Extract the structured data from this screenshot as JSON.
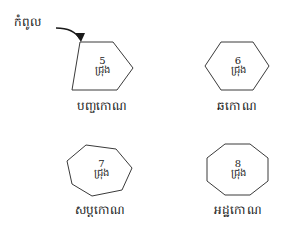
{
  "diagram": {
    "title_text": "",
    "background_color": "#ffffff",
    "stroke_color": "#3a3a3a",
    "text_color": "#1a1a1a"
  },
  "annotation": {
    "label": "កំពូល",
    "meaning_icon": "curved-arrow-icon"
  },
  "shapes": [
    {
      "name": "បញ្ចកោណ",
      "count": "5",
      "unit": "ជ្រុង",
      "sides": 5,
      "points": "15,4 48,4 68,30 52,52 7,52"
    },
    {
      "name": "ឆកោណ",
      "count": "6",
      "unit": "ជ្រុង",
      "sides": 6,
      "points": "18,2 50,2 66,26 50,50 18,50 2,26"
    },
    {
      "name": "សប្តកោណ",
      "count": "7",
      "unit": "ជ្រុង",
      "sides": 7,
      "points": "22,1 52,5 68,24 58,46 28,52 8,40 3,17"
    },
    {
      "name": "អដ្ឋកោណ",
      "count": "8",
      "unit": "ជ្រុង",
      "sides": 8,
      "points": "20,1 45,1 63,15 63,38 45,52 20,52 2,38 2,15"
    }
  ]
}
